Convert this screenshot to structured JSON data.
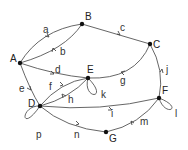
{
  "diagram": {
    "type": "directed-graph",
    "nodes": [
      {
        "id": "A",
        "label": "A"
      },
      {
        "id": "B",
        "label": "B"
      },
      {
        "id": "C",
        "label": "C"
      },
      {
        "id": "D",
        "label": "D"
      },
      {
        "id": "E",
        "label": "E"
      },
      {
        "id": "F",
        "label": "F"
      },
      {
        "id": "G",
        "label": "G"
      }
    ],
    "edges": [
      {
        "label": "a",
        "from": "A",
        "to": "B"
      },
      {
        "label": "b",
        "from": "B",
        "to": "A"
      },
      {
        "label": "c",
        "from": "B",
        "to": "C"
      },
      {
        "label": "d",
        "from": "A",
        "to": "E"
      },
      {
        "label": "e",
        "from": "A",
        "to": "D"
      },
      {
        "label": "f",
        "from": "D",
        "to": "E"
      },
      {
        "label": "g",
        "from": "C",
        "to": "E"
      },
      {
        "label": "h",
        "from": "E",
        "to": "D"
      },
      {
        "label": "i",
        "from": "D",
        "to": "F"
      },
      {
        "label": "j",
        "from": "F",
        "to": "C"
      },
      {
        "label": "k",
        "from": "E",
        "to": "E"
      },
      {
        "label": "l",
        "from": "F",
        "to": "F"
      },
      {
        "label": "m",
        "from": "F",
        "to": "G"
      },
      {
        "label": "n",
        "from": "D",
        "to": "G"
      },
      {
        "label": "p",
        "from": "D",
        "to": "D"
      }
    ]
  }
}
